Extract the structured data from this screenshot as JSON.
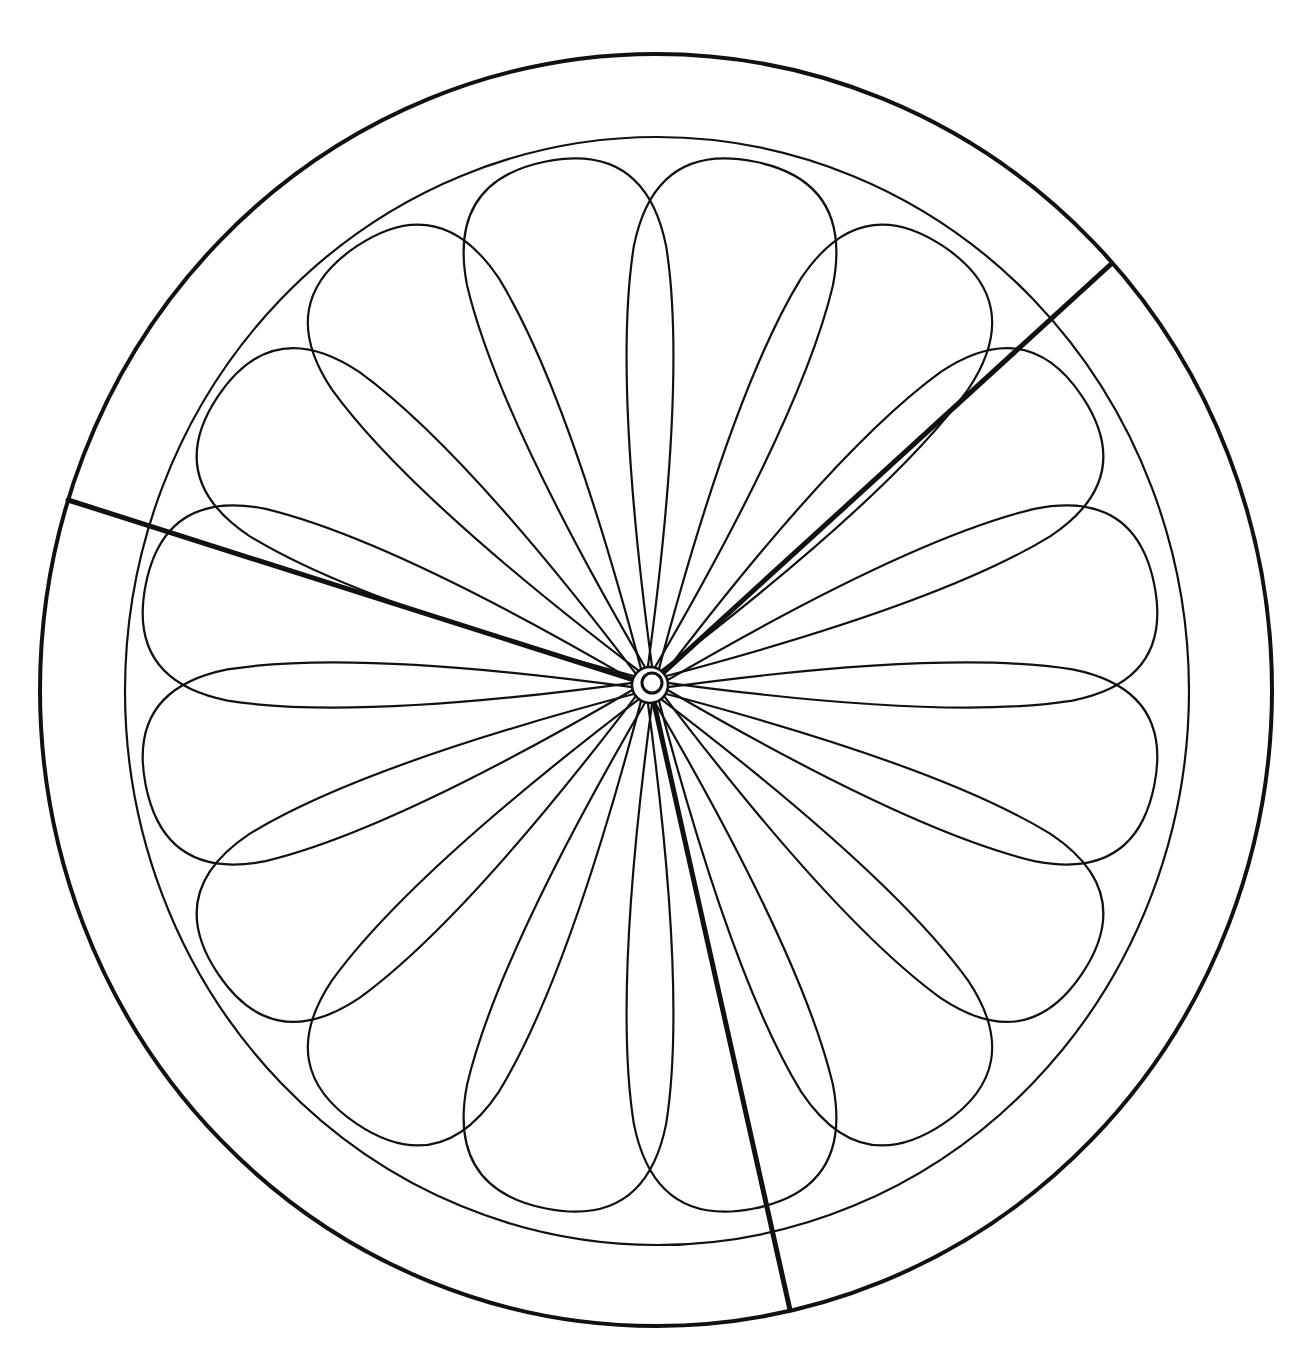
{
  "figure": {
    "stroke_color": "#111111",
    "background_color": "#ffffff",
    "canvas": {
      "width": 1311,
      "height": 1367
    },
    "center": {
      "x": 650,
      "y": 685
    },
    "outer_rind": {
      "cx": 656,
      "cy": 690,
      "rx": 616,
      "ry": 636,
      "stroke_width": 4
    },
    "inner_edge": {
      "cx": 657,
      "cy": 691,
      "rx": 532,
      "ry": 554,
      "stroke_width": 2.2
    },
    "core": {
      "r_outer": 18,
      "r_inner": 10
    },
    "segments": {
      "count": 16,
      "start_angle_deg": -101.25,
      "tip_reach_ratio": 0.965,
      "half_width_ratio": 0.19,
      "stroke_width": 2.2
    },
    "wedge_cuts": [
      {
        "x2": 1110,
        "y2": 265
      },
      {
        "x2": 68,
        "y2": 500
      },
      {
        "x2": 790,
        "y2": 1310
      }
    ],
    "wedge_stroke_width": 5
  }
}
